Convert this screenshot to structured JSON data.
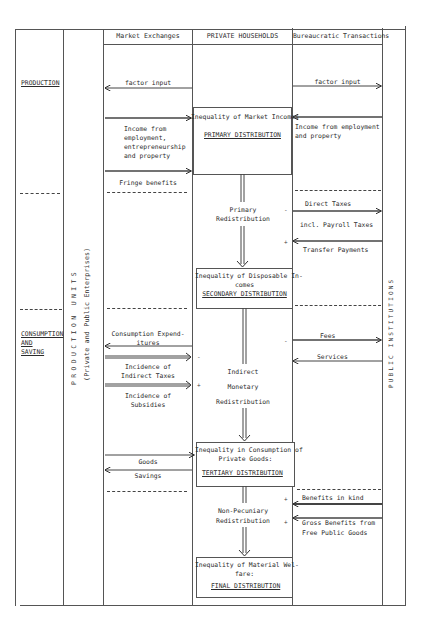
{
  "columns": {
    "market_exchanges": "Market Exchanges",
    "private_households": "PRIVATE HOUSEHOLDS",
    "bureaucratic_transactions": "Bureaucratic Transactions"
  },
  "side_labels": {
    "production": "PRODUCTION",
    "consumption_and_saving": [
      "CONSUMPTION",
      "AND",
      "SAVING"
    ],
    "production_units": "PRODUCTION UNITS",
    "production_units_sub": "(Private and Public Enterprises)",
    "public_institutions": "PUBLIC INSTITUTIONS"
  },
  "market_flows": {
    "factor_input": "factor input",
    "income_from": [
      "Income from",
      "employment,",
      "entrepreneurship",
      "and property"
    ],
    "fringe_benefits": "Fringe benefits",
    "consumption_expenditures": [
      "Consumption Expend-",
      "itures"
    ],
    "incidence_indirect_taxes": [
      "Incidence of",
      "Indirect Taxes"
    ],
    "incidence_subsidies": [
      "Incidence of",
      "Subsidies"
    ],
    "goods": "Goods",
    "savings": "Savings"
  },
  "bureaucratic_flows": {
    "factor_input": "factor input",
    "income_from": [
      "Income from employment",
      "and property"
    ],
    "direct_taxes": "Direct Taxes",
    "payroll_taxes": "incl. Payroll Taxes",
    "transfer_payments": "Transfer Payments",
    "fees": "Fees",
    "services": "Services",
    "benefits_in_kind": "Benefits in kind",
    "gross_benefits": [
      "Gross Benefits from",
      "Free Public Goods"
    ]
  },
  "distribution_boxes": {
    "primary": {
      "title": "Inequality of Market Incomes",
      "label": "PRIMARY DISTRIBUTION"
    },
    "secondary": {
      "title": [
        "Inequality of Disposable In-",
        "comes"
      ],
      "label": "SECONDARY DISTRIBUTION"
    },
    "tertiary": {
      "title": [
        "Inequality in Consumption of",
        "Private Goods:"
      ],
      "label": "TERTIARY DISTRIBUTION"
    },
    "final": {
      "title": [
        "Inequality of Material Wel-",
        "fare:"
      ],
      "label": "FINAL DISTRIBUTION"
    }
  },
  "redistribution": {
    "primary": [
      "Primary",
      "Redistribution"
    ],
    "indirect": [
      "Indirect",
      "Monetary",
      "Redistribution"
    ],
    "non_pecuniary": [
      "Non-Pecuniary",
      "Redistribution"
    ]
  },
  "signs": {
    "minus": "-",
    "plus": "+"
  }
}
